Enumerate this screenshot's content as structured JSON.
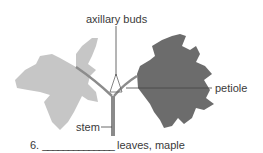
{
  "labels": {
    "axillary_buds": "axillary buds",
    "petiole": "petiole",
    "stem": "stem"
  },
  "caption": {
    "number": "6.",
    "blank": "______________",
    "text": "leaves, maple"
  },
  "colors": {
    "left_leaf": "#c4c4c4",
    "right_leaf": "#6e6e6e",
    "stem": "#8a8a8a",
    "leader_line": "#444444"
  }
}
